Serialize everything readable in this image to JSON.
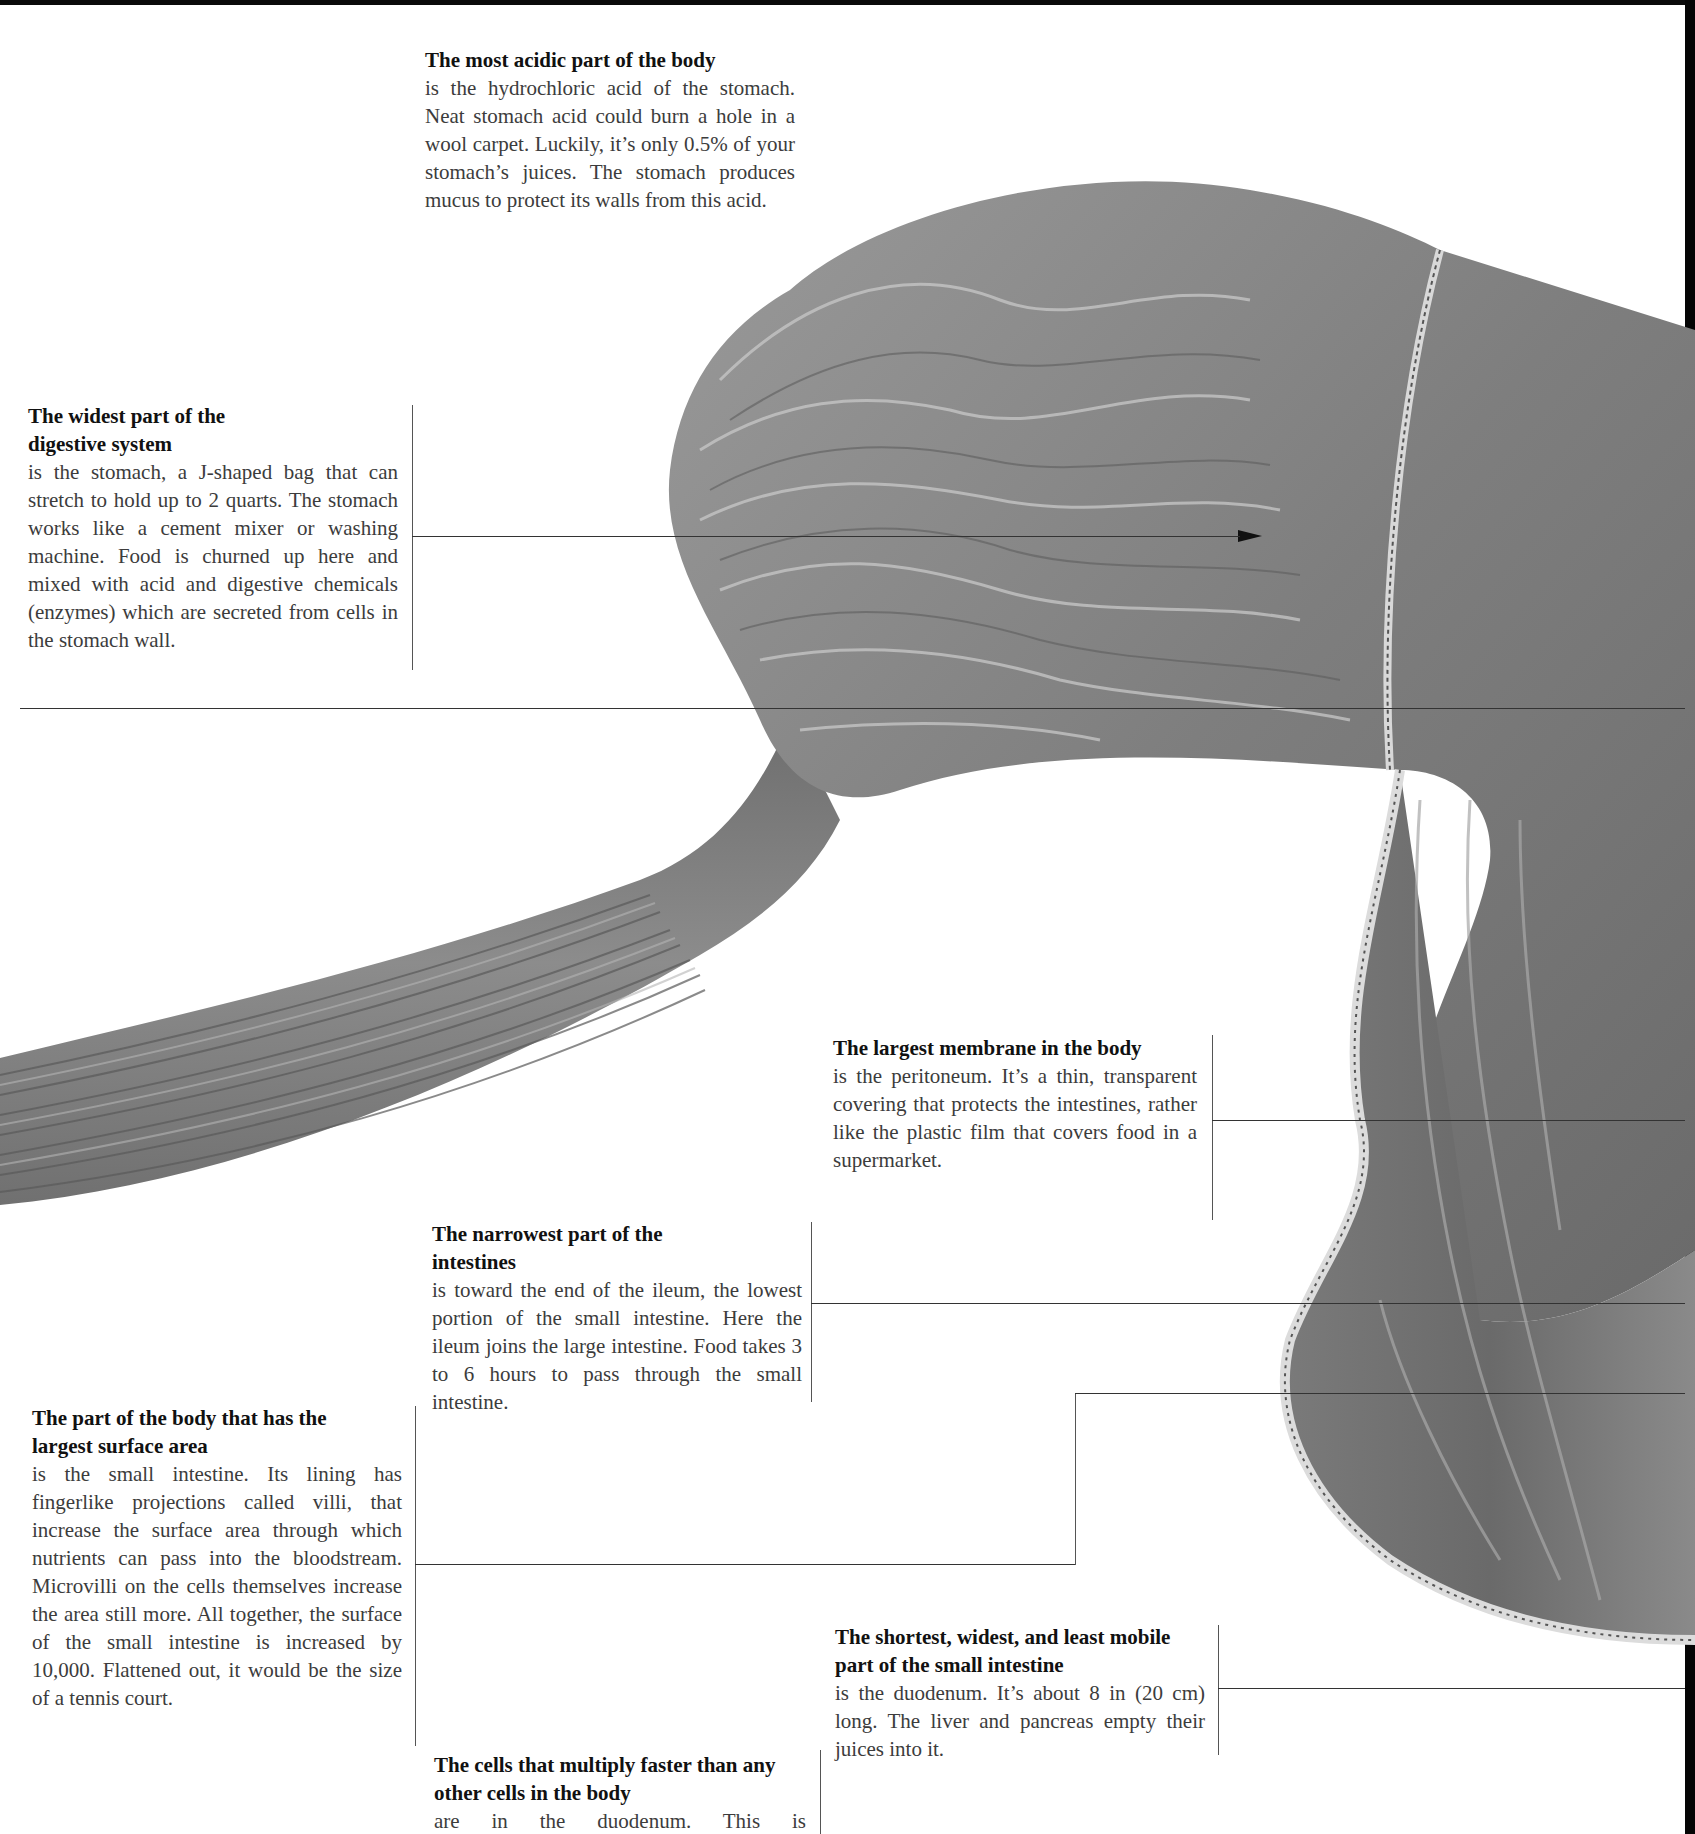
{
  "page": {
    "colors": {
      "background": "#ffffff",
      "title_text": "#111111",
      "body_text": "#3c3c3c",
      "leader_line": "#333333",
      "illustration_gray": "#8a8a8a",
      "border": "#050505"
    }
  },
  "callouts": [
    {
      "id": "most-acidic",
      "title": "The most acidic part of the body",
      "body": "is the hydrochloric acid of the stomach. Neat stomach acid could burn a hole in a wool carpet. Luckily, it’s only 0.5% of your stomach’s juices. The stomach produces mucus to protect its walls from this acid."
    },
    {
      "id": "widest-part",
      "title": "The widest part of the digestive system",
      "body": "is the stomach, a J-shaped bag that can stretch to hold up to 2 quarts. The stomach works like a cement mixer or washing machine. Food is churned up here and mixed with acid and digestive chemicals (enzymes) which are secreted from cells in the stomach wall."
    },
    {
      "id": "largest-membrane",
      "title": "The largest membrane in the body",
      "body": "is the peritoneum. It’s a thin, transparent covering that protects the intestines, rather like the plastic film that covers food in a supermarket."
    },
    {
      "id": "narrowest-part",
      "title": "The narrowest part of the intestines",
      "body": "is toward the end of the ileum, the lowest portion of the small intestine. Here the ileum joins the large intestine. Food takes 3 to 6 hours to pass through the small intestine."
    },
    {
      "id": "largest-surface",
      "title": "The part of the body that has the largest surface area",
      "body": "is the small intestine. Its lining has fingerlike projections called villi, that increase the surface area through which nutrients can pass into the bloodstream. Microvilli on the cells themselves increase the area still more. All together, the surface of the small intestine is increased by 10,000. Flattened out, it would be the size of a tennis court."
    },
    {
      "id": "shortest-widest",
      "title": "The shortest, widest, and least mobile part of the small intestine",
      "body": "is the duodenum. It’s about 8 in (20 cm) long. The liver and pancreas empty their juices into it."
    },
    {
      "id": "fastest-cells",
      "title": "The cells that multiply faster than any other cells in the body",
      "body": "are in the duodenum. This is"
    }
  ],
  "illustration": {
    "labels": [
      "esophagus",
      "stomach",
      "peritoneum",
      "duodenum",
      "small intestine"
    ],
    "arrow_icon": "arrowhead-right"
  }
}
